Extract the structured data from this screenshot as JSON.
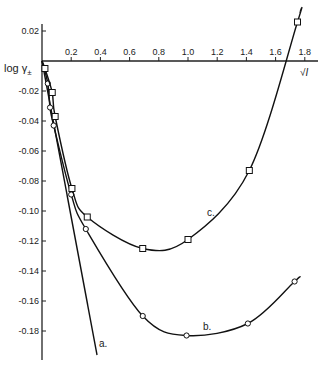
{
  "chart_data": {
    "type": "line",
    "title": "",
    "xlabel": "√I",
    "ylabel": "log γ±",
    "xlim": [
      0,
      1.85
    ],
    "ylim": [
      -0.2,
      0.025
    ],
    "grid": false,
    "x_ticks": [
      "0.2",
      "0.4",
      "0.6",
      "0.8",
      "1.0",
      "1.2",
      "1.4",
      "1.6",
      "1.8"
    ],
    "x_tick_values": [
      0.2,
      0.4,
      0.6,
      0.8,
      1.0,
      1.2,
      1.4,
      1.6,
      1.8
    ],
    "y_ticks": [
      "0.02",
      "-0.02",
      "-0.04",
      "-0.06",
      "-0.08",
      "-0.10",
      "-0.12",
      "-0.14",
      "-0.16",
      "-0.18"
    ],
    "y_tick_values": [
      0.02,
      -0.02,
      -0.04,
      -0.06,
      -0.08,
      -0.1,
      -0.12,
      -0.14,
      -0.16,
      -0.18
    ],
    "series": [
      {
        "name": "a.",
        "marker": "none",
        "x": [
          0,
          0.377
        ],
        "y": [
          0,
          -0.196
        ]
      },
      {
        "name": "b.",
        "marker": "circle",
        "x": [
          0.04,
          0.055,
          0.08,
          0.2,
          0.3,
          0.69,
          0.99,
          1.41,
          1.73
        ],
        "y": [
          -0.015,
          -0.031,
          -0.043,
          -0.089,
          -0.112,
          -0.17,
          -0.183,
          -0.175,
          -0.147
        ]
      },
      {
        "name": "c.",
        "marker": "square",
        "x": [
          0.02,
          0.07,
          0.09,
          0.205,
          0.31,
          0.69,
          1.0,
          1.42,
          1.75
        ],
        "y": [
          -0.005,
          -0.021,
          -0.037,
          -0.085,
          -0.104,
          -0.125,
          -0.119,
          -0.073,
          0.026
        ]
      }
    ],
    "annotations": [
      "a.",
      "b.",
      "c."
    ]
  }
}
